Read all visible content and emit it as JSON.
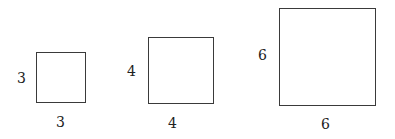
{
  "squares": [
    {
      "side_label": "3",
      "bottom_label": "3"
    },
    {
      "side_label": "4",
      "bottom_label": "4"
    },
    {
      "side_label": "6",
      "bottom_label": "6"
    }
  ]
}
